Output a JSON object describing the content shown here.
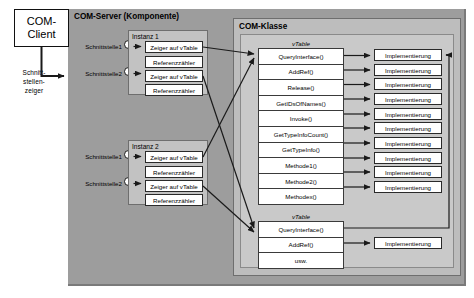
{
  "client": {
    "title_line1": "COM-",
    "title_line2": "Client",
    "pointer_label": "Schnitt-\nstellen-\nzeiger"
  },
  "server": {
    "title": "COM-Server (Komponente)",
    "interfaces": [
      {
        "label": "Schnittstelle1"
      },
      {
        "label": "Schnittstelle2"
      },
      {
        "label": "Schnittstelle1"
      },
      {
        "label": "Schnittstelle2"
      }
    ],
    "instances": [
      {
        "title": "Instanz 1",
        "slots": [
          {
            "pointer": "Zeiger auf vTable",
            "counter": "Referenzzähler"
          },
          {
            "pointer": "Zeiger auf vTable",
            "counter": "Referenzzähler"
          }
        ]
      },
      {
        "title": "Instanz 2",
        "slots": [
          {
            "pointer": "Zeiger auf vTable",
            "counter": "Referenzzähler"
          },
          {
            "pointer": "Zeiger auf vTable",
            "counter": "Referenzzähler"
          }
        ]
      }
    ]
  },
  "klasse": {
    "title": "COM-Klasse",
    "vtables": [
      {
        "label": "vTable",
        "methods": [
          "QueryInterface()",
          "AddRef()",
          "Release()",
          "GetIDsOfNames()",
          "Invoke()",
          "GetTypeInfoCount()",
          "GetTypeInfo()",
          "Methode1()",
          "Methode2()",
          "Methodex()"
        ]
      },
      {
        "label": "vTable",
        "methods": [
          "QueryInterface()",
          "AddRef()",
          "usw."
        ]
      }
    ],
    "implementation_label": "Implementierung",
    "implementation_count_top": 10,
    "implementation_count_bottom": 1
  },
  "colors": {
    "server_bg": "#9d9d9d",
    "klasse_bg": "#bdbdbd",
    "klasse_inner_bg": "#c9c9c9",
    "instanz_bg": "#c2c2c2",
    "box_bg": "#ffffff",
    "line": "#1a1a1a",
    "page_bg": "#ffffff"
  }
}
